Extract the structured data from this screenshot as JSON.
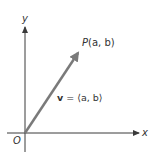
{
  "diagram": {
    "axes": {
      "x_label": "x",
      "y_label": "y",
      "origin_label": "O"
    },
    "point": {
      "label_name": "P",
      "label_coords": "(a, b)"
    },
    "vector": {
      "symbol": "v",
      "equals": " = ",
      "components": "⟨a, b⟩"
    },
    "colors": {
      "axis": "#3a3a3a",
      "vector": "#7a7a7a",
      "text": "#333333",
      "background": "#ffffff"
    }
  }
}
